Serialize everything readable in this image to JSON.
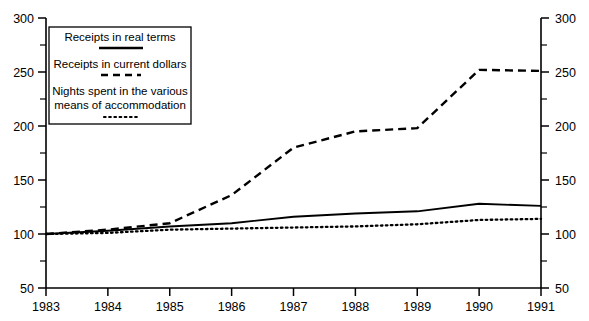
{
  "chart_data": {
    "type": "line",
    "title": "",
    "subtitle": "",
    "xlabel": "",
    "ylabel": "",
    "x": [
      1983,
      1984,
      1985,
      1986,
      1987,
      1988,
      1989,
      1990,
      1991
    ],
    "categories": [
      "1983",
      "1984",
      "1985",
      "1986",
      "1987",
      "1988",
      "1989",
      "1990",
      "1991"
    ],
    "ylim": [
      50,
      300
    ],
    "yticks": [
      50,
      100,
      150,
      200,
      250,
      300
    ],
    "yticklabels": [
      "50",
      "100",
      "150",
      "200",
      "250",
      "300"
    ],
    "y_minor_ticks": [
      75,
      125,
      175,
      225,
      275
    ],
    "right_axis": {
      "ylim": [
        50,
        300
      ],
      "yticks": [
        50,
        100,
        150,
        200,
        250,
        300
      ],
      "yticklabels": [
        "50",
        "100",
        "150",
        "200",
        "250",
        "300"
      ]
    },
    "xticklabels": [
      "1983",
      "1984",
      "1985",
      "1986",
      "1987",
      "1988",
      "1989",
      "1990",
      "1991"
    ],
    "grid": false,
    "legend_position": "upper-left-inside",
    "series": [
      {
        "name": "Receipts in real terms",
        "style": "solid",
        "values": [
          100,
          103,
          107,
          110,
          116,
          119,
          121,
          128,
          126
        ]
      },
      {
        "name": "Receipts in current dollars",
        "style": "dashed",
        "values": [
          100,
          104,
          110,
          136,
          180,
          195,
          198,
          252,
          251
        ]
      },
      {
        "name": "Nights spent in the various means of accommodation",
        "style": "dotted",
        "values": [
          100,
          101,
          104,
          105,
          106,
          107,
          109,
          113,
          114
        ]
      }
    ]
  },
  "legend": {
    "entries": [
      {
        "label": "Receipts in real terms",
        "label_line_2": "",
        "style": "solid"
      },
      {
        "label": "Receipts in current dollars",
        "label_line_2": "",
        "style": "dashed"
      },
      {
        "label": "Nights spent in the various",
        "label_line_2": "means of accommodation",
        "style": "dotted"
      }
    ]
  },
  "axes": {
    "left_labels": [
      "300",
      "250",
      "200",
      "150",
      "100",
      "50"
    ],
    "right_labels": [
      "300",
      "250",
      "200",
      "150",
      "100",
      "50"
    ],
    "bottom_labels": [
      "1983",
      "1984",
      "1985",
      "1986",
      "1987",
      "1988",
      "1989",
      "1990",
      "1991"
    ]
  },
  "colors": {
    "ink": "#000000",
    "background": "#ffffff"
  }
}
